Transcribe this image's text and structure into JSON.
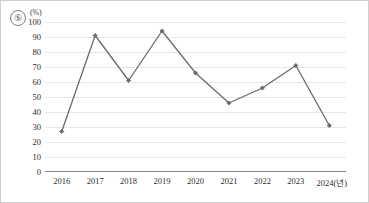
{
  "figure": {
    "marker_number": "⑤",
    "unit_label": "(%)",
    "accent_color": "#6b6b6b",
    "gridline_color": "#e6e6e6",
    "axis_color": "#8a8a8a",
    "text_color": "#2d2d2d"
  },
  "chart_data": {
    "type": "line",
    "title": "",
    "xlabel": "",
    "ylabel": "",
    "unit": "(%)",
    "x_axis_unit_suffix": "(년)",
    "categories": [
      "2016",
      "2017",
      "2018",
      "2019",
      "2020",
      "2021",
      "2022",
      "2023",
      "2024"
    ],
    "x_tick_labels": [
      "2016",
      "2017",
      "2018",
      "2019",
      "2020",
      "2021",
      "2022",
      "2023",
      "2024(년)"
    ],
    "values": [
      27,
      91,
      61,
      94,
      66,
      46,
      56,
      71,
      31
    ],
    "ylim": [
      0,
      100
    ],
    "ytick_labels": [
      "0",
      "10",
      "20",
      "30",
      "40",
      "50",
      "60",
      "70",
      "80",
      "90",
      "100"
    ],
    "yticks": [
      0,
      10,
      20,
      30,
      40,
      50,
      60,
      70,
      80,
      90,
      100
    ],
    "grid": true,
    "grid_axis": "y",
    "legend": false,
    "markers": "diamond",
    "series": [
      {
        "name": "series-1",
        "values": [
          27,
          91,
          61,
          94,
          66,
          46,
          56,
          71,
          31
        ]
      }
    ]
  }
}
